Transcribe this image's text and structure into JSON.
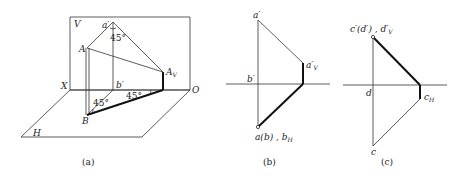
{
  "figure_a": {
    "caption": "(a)",
    "labels": {
      "V": "V",
      "H": "H",
      "X": "X",
      "O": "O",
      "a_prime": "a′",
      "b_prime": "b′",
      "A": "A",
      "B": "B",
      "A_V": "A",
      "A_V_sub": "V",
      "angle_top": "45°",
      "angle_b": "45°",
      "angle_right": "45°"
    }
  },
  "figure_b": {
    "caption": "(b)",
    "labels": {
      "a_prime": "a′",
      "a_prime_V": "a′",
      "a_prime_V_sub": "V",
      "b_prime": "b′",
      "a_b": "a(b) , b",
      "a_b_sub": "H"
    }
  },
  "figure_c": {
    "caption": "(c)",
    "labels": {
      "c_prime_d_prime": "c′(d′) , d′",
      "c_prime_d_prime_sub": "V",
      "d": "d",
      "c_H": "c",
      "c_H_sub": "H",
      "c": "c"
    }
  }
}
